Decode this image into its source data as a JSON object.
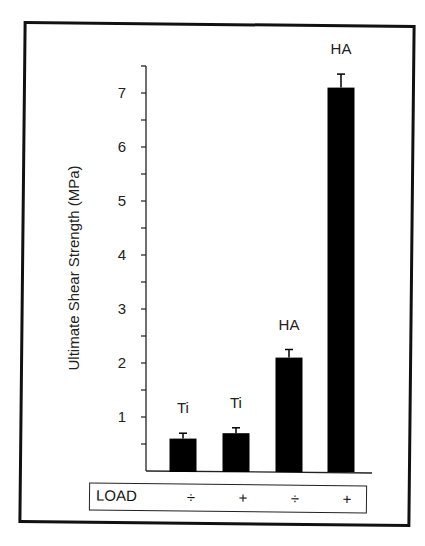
{
  "chart_data": {
    "type": "bar",
    "title": "",
    "xlabel": "",
    "ylabel": "Ultimate Shear Strength (MPa)",
    "ylim": [
      0,
      7.5
    ],
    "yticks": [
      1,
      2,
      3,
      4,
      5,
      6,
      7
    ],
    "minor_tick_step": 0.5,
    "grid": false,
    "categories": [
      "Ti (LOAD ÷)",
      "Ti (LOAD +)",
      "HA (LOAD ÷)",
      "HA (LOAD +)"
    ],
    "bar_labels": [
      "Ti",
      "Ti",
      "HA",
      "HA"
    ],
    "load_row": {
      "label": "LOAD",
      "values": [
        "÷",
        "+",
        "÷",
        "+"
      ]
    },
    "values": [
      0.6,
      0.7,
      2.1,
      7.1
    ],
    "error": [
      0.1,
      0.1,
      0.15,
      0.25
    ],
    "bar_color": "#000000"
  }
}
